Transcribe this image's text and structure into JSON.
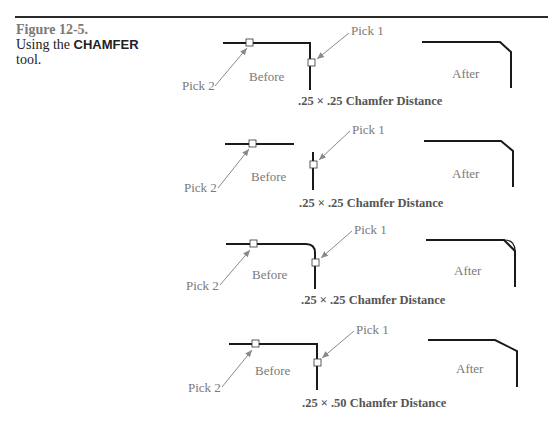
{
  "figure": {
    "number": "Figure 12-5.",
    "caption_prefix": "Using the",
    "tool_name": "CHAMFER",
    "caption_suffix": "tool."
  },
  "labels": {
    "pick1": "Pick 1",
    "pick2": "Pick 2",
    "before": "Before",
    "after": "After"
  },
  "panels": [
    {
      "caption": ".25 × .25 Chamfer Distance",
      "type": "corner-to-chamfer"
    },
    {
      "caption": ".25 × .25 Chamfer Distance",
      "type": "gap-to-chamfer"
    },
    {
      "caption": ".25 × .25 Chamfer Distance",
      "type": "fillet-to-chamfer"
    },
    {
      "caption": ".25 × .50 Chamfer Distance",
      "type": "corner-to-unequal-chamfer"
    }
  ],
  "colors": {
    "line": "#1a1a1a",
    "arrow": "#8a8a8a",
    "label": "#7a7a7a"
  }
}
